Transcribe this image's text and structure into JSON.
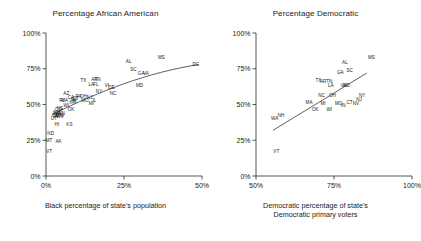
{
  "figure": {
    "background": "#ffffff",
    "ink_color": "#1a1a1a"
  },
  "panels": [
    {
      "id": "left",
      "title": "Percentage African American",
      "xlabel_line1": "Black percentage of state's population",
      "xlabel_line2": ""
    },
    {
      "id": "right",
      "title": "Percentage Democratic",
      "xlabel_line1": "Democratic percentage of state's",
      "xlabel_line2": "Democratic primary voters"
    }
  ],
  "chart_data": [
    {
      "type": "scatter",
      "id": "percentage-african-american",
      "title": "Percentage African American",
      "xlabel": "Black percentage of state's population",
      "ylabel": "",
      "xlim": [
        0,
        50
      ],
      "ylim": [
        0,
        100
      ],
      "xticks": [
        0,
        25,
        50
      ],
      "xticklabels": [
        "0%",
        "25%",
        "50%"
      ],
      "yticks": [
        0,
        25,
        50,
        75,
        100
      ],
      "yticklabels": [
        "0%",
        "25%",
        "50%",
        "75%",
        "100%"
      ],
      "grid": false,
      "legend": "none",
      "point_labels_are_markers": true,
      "fit_curve": "smoothed increasing curve through cluster",
      "points": [
        {
          "label": "DC",
          "x": 48.0,
          "y": 77.0
        },
        {
          "label": "MS",
          "x": 37.0,
          "y": 82.0
        },
        {
          "label": "AL",
          "x": 26.5,
          "y": 79.0
        },
        {
          "label": "SC",
          "x": 28.0,
          "y": 73.5
        },
        {
          "label": "GA",
          "x": 30.5,
          "y": 70.5
        },
        {
          "label": "VA",
          "x": 32.0,
          "y": 70.5
        },
        {
          "label": "MD",
          "x": 30.0,
          "y": 62.0
        },
        {
          "label": "DE",
          "x": 21.0,
          "y": 60.5
        },
        {
          "label": "NC",
          "x": 21.5,
          "y": 56.5
        },
        {
          "label": "NY",
          "x": 17.0,
          "y": 58.0
        },
        {
          "label": "VI",
          "x": 19.5,
          "y": 62.5
        },
        {
          "label": "TX",
          "x": 12.0,
          "y": 65.5
        },
        {
          "label": "AR",
          "x": 15.5,
          "y": 66.5
        },
        {
          "label": "TN",
          "x": 16.5,
          "y": 66.5
        },
        {
          "label": "LA",
          "x": 14.5,
          "y": 63.0
        },
        {
          "label": "FL",
          "x": 16.0,
          "y": 63.0
        },
        {
          "label": "OH",
          "x": 12.0,
          "y": 54.5
        },
        {
          "label": "PA",
          "x": 10.5,
          "y": 54.5
        },
        {
          "label": "NJ",
          "x": 14.0,
          "y": 54.0
        },
        {
          "label": "IL",
          "x": 15.5,
          "y": 52.0
        },
        {
          "label": "MO",
          "x": 12.5,
          "y": 52.0
        },
        {
          "label": "MI",
          "x": 14.5,
          "y": 49.5
        },
        {
          "label": "AZ",
          "x": 6.5,
          "y": 56.5
        },
        {
          "label": "CA",
          "x": 8.0,
          "y": 53.5
        },
        {
          "label": "CT",
          "x": 9.5,
          "y": 53.0
        },
        {
          "label": "NV",
          "x": 9.0,
          "y": 52.5
        },
        {
          "label": "MA",
          "x": 6.0,
          "y": 52.0
        },
        {
          "label": "RI",
          "x": 5.0,
          "y": 51.5
        },
        {
          "label": "IN",
          "x": 9.0,
          "y": 51.0
        },
        {
          "label": "KY",
          "x": 8.5,
          "y": 50.5
        },
        {
          "label": "WI",
          "x": 6.5,
          "y": 48.5
        },
        {
          "label": "OK",
          "x": 8.0,
          "y": 45.5
        },
        {
          "label": "NE",
          "x": 4.5,
          "y": 46.5
        },
        {
          "label": "CO",
          "x": 4.0,
          "y": 45.5
        },
        {
          "label": "MN",
          "x": 5.0,
          "y": 43.0
        },
        {
          "label": "WA",
          "x": 3.5,
          "y": 42.5
        },
        {
          "label": "OR",
          "x": 3.0,
          "y": 41.5
        },
        {
          "label": "IA",
          "x": 3.0,
          "y": 40.5
        },
        {
          "label": "NM",
          "x": 4.5,
          "y": 41.0
        },
        {
          "label": "NH",
          "x": 3.5,
          "y": 43.5
        },
        {
          "label": "WV",
          "x": 4.5,
          "y": 40.5
        },
        {
          "label": "UT",
          "x": 2.5,
          "y": 39.0
        },
        {
          "label": "HI",
          "x": 3.5,
          "y": 35.0
        },
        {
          "label": "KS",
          "x": 7.5,
          "y": 35.0
        },
        {
          "label": "ND",
          "x": 1.5,
          "y": 29.0
        },
        {
          "label": "MT",
          "x": 1.0,
          "y": 23.5
        },
        {
          "label": "AK",
          "x": 4.0,
          "y": 23.0
        },
        {
          "label": "VT",
          "x": 1.0,
          "y": 16.0
        }
      ]
    },
    {
      "type": "scatter",
      "id": "percentage-democratic",
      "title": "Percentage Democratic",
      "xlabel": "Democratic percentage of state's Democratic primary voters",
      "ylabel": "",
      "xlim": [
        50,
        100
      ],
      "ylim": [
        0,
        100
      ],
      "xticks": [
        50,
        75,
        100
      ],
      "xticklabels": [
        "50%",
        "75%",
        "100%"
      ],
      "yticks": [
        0,
        25,
        50,
        75,
        100
      ],
      "yticklabels": [
        "0%",
        "25%",
        "50%",
        "75%",
        "100%"
      ],
      "grid": false,
      "legend": "none",
      "point_labels_are_markers": true,
      "fit_curve": "straight increasing regression line",
      "points": [
        {
          "label": "MS",
          "x": 87.0,
          "y": 81.5
        },
        {
          "label": "AL",
          "x": 78.5,
          "y": 78.5
        },
        {
          "label": "SC",
          "x": 80.0,
          "y": 73.0
        },
        {
          "label": "GA",
          "x": 77.0,
          "y": 71.5
        },
        {
          "label": "AR",
          "x": 71.5,
          "y": 65.0
        },
        {
          "label": "TN",
          "x": 73.5,
          "y": 65.0
        },
        {
          "label": "LA",
          "x": 74.0,
          "y": 62.5
        },
        {
          "label": "VA",
          "x": 78.0,
          "y": 62.5
        },
        {
          "label": "MD",
          "x": 79.0,
          "y": 62.0
        },
        {
          "label": "TX",
          "x": 70.0,
          "y": 65.5
        },
        {
          "label": "NC",
          "x": 71.0,
          "y": 55.0
        },
        {
          "label": "OH",
          "x": 74.5,
          "y": 55.0
        },
        {
          "label": "NY",
          "x": 84.0,
          "y": 55.0
        },
        {
          "label": "NJ",
          "x": 83.0,
          "y": 52.5
        },
        {
          "label": "MA",
          "x": 67.0,
          "y": 50.5
        },
        {
          "label": "MI",
          "x": 71.5,
          "y": 49.5
        },
        {
          "label": "MO",
          "x": 76.5,
          "y": 50.0
        },
        {
          "label": "CT",
          "x": 80.0,
          "y": 50.5
        },
        {
          "label": "NV",
          "x": 82.0,
          "y": 49.5
        },
        {
          "label": "IN",
          "x": 78.0,
          "y": 48.0
        },
        {
          "label": "OK",
          "x": 69.0,
          "y": 45.5
        },
        {
          "label": "WI",
          "x": 73.5,
          "y": 45.5
        },
        {
          "label": "WA",
          "x": 56.0,
          "y": 39.5
        },
        {
          "label": "NH",
          "x": 58.0,
          "y": 41.0
        },
        {
          "label": "VT",
          "x": 56.5,
          "y": 16.0
        }
      ]
    }
  ]
}
